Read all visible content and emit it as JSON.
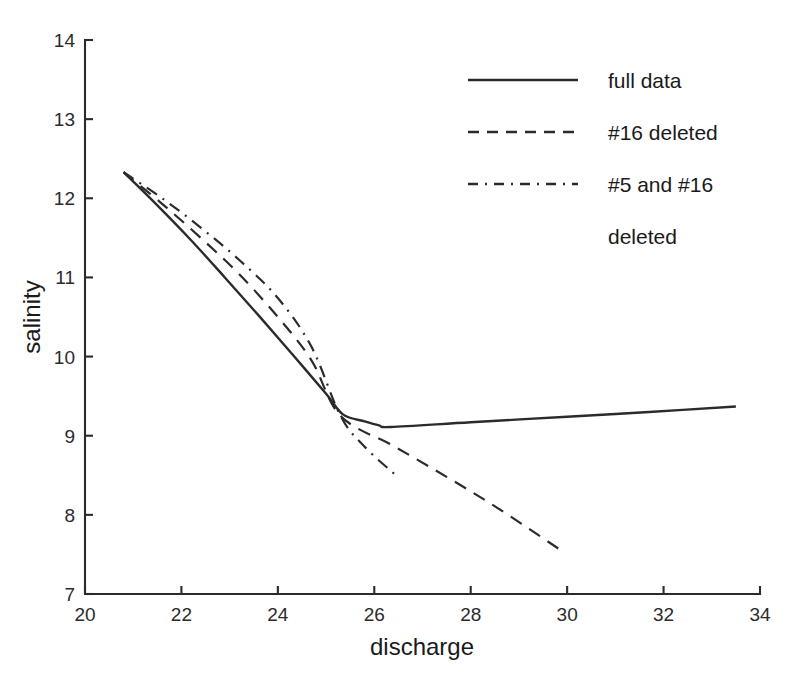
{
  "chart_data": {
    "type": "line",
    "title": "",
    "xlabel": "discharge",
    "ylabel": "salinity",
    "xlim": [
      20,
      34
    ],
    "ylim": [
      7,
      14
    ],
    "xticks": [
      20,
      22,
      24,
      26,
      28,
      30,
      32,
      34
    ],
    "yticks": [
      7,
      8,
      9,
      10,
      11,
      12,
      13,
      14
    ],
    "grid": false,
    "legend_position": "top-right",
    "series": [
      {
        "name": "full data",
        "style": "solid",
        "x": [
          20.8,
          21.5,
          22.2,
          22.9,
          23.6,
          24.3,
          25.0,
          25.35,
          25.8,
          26.1,
          26.35,
          28.0,
          30.0,
          31.7,
          33.5
        ],
        "y": [
          12.33,
          11.91,
          11.47,
          11.0,
          10.52,
          10.03,
          9.53,
          9.27,
          9.18,
          9.13,
          9.11,
          9.17,
          9.24,
          9.3,
          9.37
        ]
      },
      {
        "name": "#16 deleted",
        "style": "dashed",
        "x": [
          20.8,
          21.6,
          22.4,
          23.2,
          24.0,
          24.7,
          25.3,
          26.4,
          27.5,
          28.6,
          29.9
        ],
        "y": [
          12.33,
          11.93,
          11.5,
          11.04,
          10.5,
          9.95,
          9.25,
          8.87,
          8.48,
          8.07,
          7.54
        ]
      },
      {
        "name": "#5 and #16 deleted",
        "style": "dashdot",
        "x": [
          20.8,
          21.6,
          22.4,
          23.2,
          24.0,
          24.7,
          25.3,
          25.8,
          26.45
        ],
        "y": [
          12.33,
          12.0,
          11.63,
          11.22,
          10.74,
          10.12,
          9.25,
          8.86,
          8.5
        ]
      }
    ]
  },
  "axes": {
    "xlabel": "discharge",
    "ylabel": "salinity",
    "xticklabels": [
      "20",
      "22",
      "24",
      "26",
      "28",
      "30",
      "32",
      "34"
    ],
    "yticklabels": [
      "7",
      "8",
      "9",
      "10",
      "11",
      "12",
      "13",
      "14"
    ]
  },
  "legend": {
    "entries": [
      {
        "label": "full data",
        "style": "solid"
      },
      {
        "label": "#16 deleted",
        "style": "dashed"
      },
      {
        "label": "#5 and #16",
        "style": "dashdot"
      },
      {
        "label": "deleted",
        "style": "none"
      }
    ]
  },
  "colors": {
    "line": "#2b2b2b",
    "text": "#1a1a1a",
    "background": "#ffffff"
  }
}
